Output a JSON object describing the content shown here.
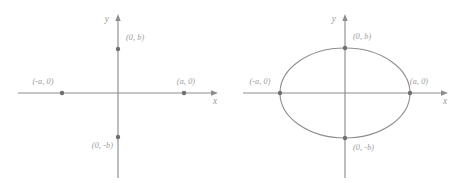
{
  "figure": {
    "title": "",
    "panels": [
      {
        "id": "panel-left",
        "name": "four-points-plot",
        "axes": {
          "x_label": "x",
          "y_label": "y",
          "origin": [
            118,
            93
          ],
          "x_extent": [
            18,
            218
          ],
          "y_extent": [
            14,
            178
          ],
          "arrowheads": [
            "x-positive",
            "y-positive"
          ]
        },
        "curve": null,
        "points": [
          {
            "name": "point-top",
            "label": "(0, b)",
            "x": 118,
            "y": 49,
            "label_x": 126,
            "label_y": 40,
            "label_anchor": "start"
          },
          {
            "name": "point-right",
            "label": "(a, 0)",
            "x": 184,
            "y": 93,
            "label_x": 186,
            "label_y": 84,
            "label_anchor": "middle"
          },
          {
            "name": "point-left",
            "label": "(-a, 0)",
            "x": 62,
            "y": 93,
            "label_x": 43,
            "label_y": 84,
            "label_anchor": "middle"
          },
          {
            "name": "point-bottom",
            "label": "(0, -b)",
            "x": 118,
            "y": 137,
            "label_x": 113,
            "label_y": 148,
            "label_anchor": "end"
          }
        ]
      },
      {
        "id": "panel-right",
        "name": "ellipse-plot",
        "axes": {
          "x_label": "x",
          "y_label": "y",
          "origin": [
            116,
            93
          ],
          "x_extent": [
            14,
            219
          ],
          "y_extent": [
            14,
            178
          ],
          "arrowheads": [
            "x-positive",
            "y-positive"
          ]
        },
        "curve": {
          "type": "ellipse",
          "center": [
            116,
            93
          ],
          "semi_axis_a": 65,
          "semi_axis_b": 45
        },
        "points": [
          {
            "name": "point-top",
            "label": "(0, b)",
            "x": 116,
            "y": 48,
            "label_x": 124,
            "label_y": 39,
            "label_anchor": "start"
          },
          {
            "name": "point-right",
            "label": "(a, 0)",
            "x": 181,
            "y": 93,
            "label_x": 190,
            "label_y": 84,
            "label_anchor": "middle"
          },
          {
            "name": "point-left",
            "label": "(-a, 0)",
            "x": 51,
            "y": 93,
            "label_x": 31,
            "label_y": 84,
            "label_anchor": "middle"
          },
          {
            "name": "point-bottom",
            "label": "(0, -b)",
            "x": 116,
            "y": 138,
            "label_x": 124,
            "label_y": 150,
            "label_anchor": "start"
          }
        ]
      }
    ],
    "colors": {
      "axis": "#8d8d8d",
      "curve": "#8d8d8d",
      "point": "#6f6f6f",
      "label_text": "#9a9a9a",
      "background": "#ffffff"
    }
  }
}
